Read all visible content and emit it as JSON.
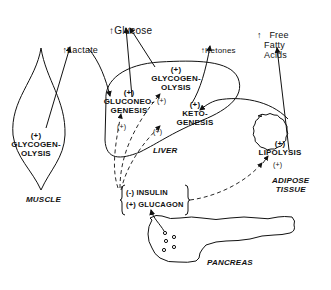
{
  "outputs": {
    "glucose": "Glucose",
    "lactate": "Lactate",
    "ketones": "Ketones",
    "ffa": "Free\nFatty\nAcids"
  },
  "organs": {
    "muscle": "MUSCLE",
    "liver": "LIVER",
    "adipose": "ADIPOSE\nTISSUE",
    "pancreas": "PANCREAS"
  },
  "processes": {
    "muscle_glycogenolysis": "(+)\nGLYCOGEN-\nOLYSIS",
    "gluconeogenesis": "(+)\nGLUCONEO-\nGENESIS",
    "liver_glycogenolysis": "(+)\nGLYCOGEN-\nOLYSIS",
    "ketogenesis": "(+)\nKETO-\nGENESIS",
    "lipolysis": "(+)\nLIPOLYSIS"
  },
  "hormones": {
    "insulin": "(-) INSULIN",
    "glucagon": "(+) GLUCAGON"
  },
  "markers": {
    "plus": "(+)",
    "up_arrow": "↑"
  }
}
